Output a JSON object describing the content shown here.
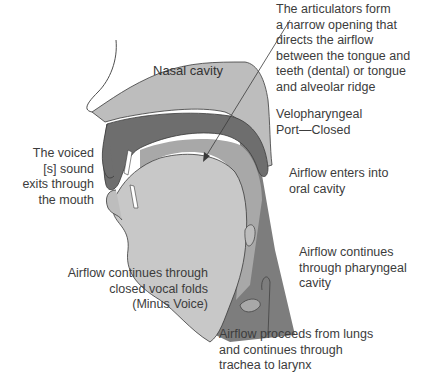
{
  "diagram": {
    "colors": {
      "background": "#ffffff",
      "nasal_cavity": "#bdbdbd",
      "velum_palate_dark": "#6e6e6e",
      "oral_cavity": "#c8c8c8",
      "tongue_border": "#5e5e5e",
      "pharynx_dark": "#7a7a7a",
      "pharynx_mid": "#999999",
      "outline": "#3a3a3a",
      "text": "#3c3c3c"
    },
    "regions": {
      "nasal_cavity": "Nasal cavity"
    },
    "labels": {
      "articulators": [
        "The articulators form",
        "a narrow opening that",
        "directs the airflow",
        "between the tongue and",
        "teeth (dental) or tongue",
        "and alveolar ridge"
      ],
      "velopharyngeal": [
        "Velopharyngeal",
        "Port—Closed"
      ],
      "voiced_s": [
        "The voiced",
        "[s] sound",
        "exits through",
        "the mouth"
      ],
      "oral_entry": [
        "Airflow enters into",
        "oral cavity"
      ],
      "pharyngeal": [
        "Airflow continues",
        "through pharyngeal",
        "cavity"
      ],
      "vocal_folds": [
        "Airflow continues through",
        "closed vocal folds",
        "(Minus Voice)"
      ],
      "lungs": [
        "Airflow proceeds from lungs",
        "and continues through",
        "trachea to larynx"
      ]
    }
  }
}
